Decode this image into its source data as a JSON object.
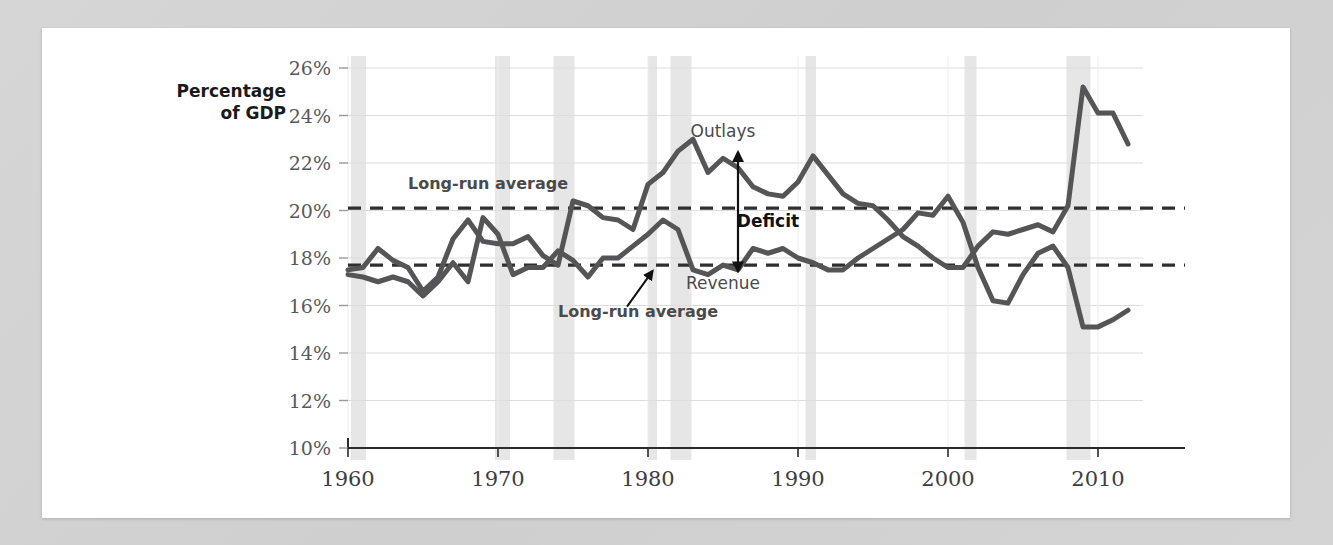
{
  "chart_data": {
    "type": "line",
    "title": "",
    "ylabel": "Percentage of GDP",
    "xlabel": "",
    "ylim": [
      10,
      26
    ],
    "xlim": [
      1960,
      2013
    ],
    "yticks": [
      "10%",
      "12%",
      "14%",
      "16%",
      "18%",
      "20%",
      "22%",
      "24%",
      "26%"
    ],
    "ytick_values": [
      10,
      12,
      14,
      16,
      18,
      20,
      22,
      24,
      26
    ],
    "xticks": [
      "1960",
      "1970",
      "1980",
      "1990",
      "2000",
      "2010"
    ],
    "xtick_values": [
      1960,
      1970,
      1980,
      1990,
      2000,
      2010
    ],
    "grid": true,
    "legend_position": "inline-annotations",
    "series": [
      {
        "name": "Outlays",
        "color": "#555557",
        "x": [
          1960,
          1961,
          1962,
          1963,
          1964,
          1965,
          1966,
          1967,
          1968,
          1969,
          1970,
          1971,
          1972,
          1973,
          1974,
          1975,
          1976,
          1977,
          1978,
          1979,
          1980,
          1981,
          1982,
          1983,
          1984,
          1985,
          1986,
          1987,
          1988,
          1989,
          1990,
          1991,
          1992,
          1993,
          1994,
          1995,
          1996,
          1997,
          1998,
          1999,
          2000,
          2001,
          2002,
          2003,
          2004,
          2005,
          2006,
          2007,
          2008,
          2009,
          2010,
          2011,
          2012
        ],
        "values": [
          17.5,
          17.6,
          18.4,
          17.9,
          17.6,
          16.6,
          17.2,
          18.8,
          19.6,
          18.7,
          18.6,
          18.6,
          18.9,
          18.1,
          17.7,
          20.4,
          20.2,
          19.7,
          19.6,
          19.2,
          21.1,
          21.6,
          22.5,
          23.0,
          21.6,
          22.2,
          21.8,
          21.0,
          20.7,
          20.6,
          21.2,
          22.3,
          21.5,
          20.7,
          20.3,
          20.2,
          19.6,
          18.9,
          18.5,
          18.0,
          17.6,
          17.6,
          18.5,
          19.1,
          19.0,
          19.2,
          19.4,
          19.1,
          20.2,
          25.2,
          24.1,
          24.1,
          22.8
        ]
      },
      {
        "name": "Revenue",
        "color": "#555557",
        "x": [
          1960,
          1961,
          1962,
          1963,
          1964,
          1965,
          1966,
          1967,
          1968,
          1969,
          1970,
          1971,
          1972,
          1973,
          1974,
          1975,
          1976,
          1977,
          1978,
          1979,
          1980,
          1981,
          1982,
          1983,
          1984,
          1985,
          1986,
          1987,
          1988,
          1989,
          1990,
          1991,
          1992,
          1993,
          1994,
          1995,
          1996,
          1997,
          1998,
          1999,
          2000,
          2001,
          2002,
          2003,
          2004,
          2005,
          2006,
          2007,
          2008,
          2009,
          2010,
          2011,
          2012
        ],
        "values": [
          17.3,
          17.2,
          17.0,
          17.2,
          17.0,
          16.4,
          17.0,
          17.8,
          17.0,
          19.7,
          19.0,
          17.3,
          17.6,
          17.6,
          18.3,
          17.9,
          17.2,
          18.0,
          18.0,
          18.5,
          19.0,
          19.6,
          19.2,
          17.5,
          17.3,
          17.7,
          17.5,
          18.4,
          18.2,
          18.4,
          18.0,
          17.8,
          17.5,
          17.5,
          18.0,
          18.4,
          18.8,
          19.2,
          19.9,
          19.8,
          20.6,
          19.5,
          17.6,
          16.2,
          16.1,
          17.3,
          18.2,
          18.5,
          17.6,
          15.1,
          15.1,
          15.4,
          15.8
        ]
      }
    ],
    "reference_lines": [
      {
        "label": "Long-run average",
        "value": 20.1,
        "series": "Outlays",
        "style": "dashed"
      },
      {
        "label": "Long-run average",
        "value": 17.7,
        "series": "Revenue",
        "style": "dashed"
      }
    ],
    "annotations": [
      {
        "text": "Outlays",
        "x": 1985,
        "y": 23.1
      },
      {
        "text": "Revenue",
        "x": 1985,
        "y": 16.7
      },
      {
        "text": "Deficit",
        "x": 1988,
        "y": 19.3
      },
      {
        "text": "Long-run average",
        "x": 1964,
        "y": 20.9
      },
      {
        "text": "Long-run average",
        "x": 1974,
        "y": 15.5
      }
    ],
    "recession_bands": [
      {
        "start": 1960.2,
        "end": 1961.2
      },
      {
        "start": 1969.8,
        "end": 1970.8
      },
      {
        "start": 1973.7,
        "end": 1975.1
      },
      {
        "start": 1980.0,
        "end": 1980.6
      },
      {
        "start": 1981.5,
        "end": 1982.9
      },
      {
        "start": 1990.5,
        "end": 1991.2
      },
      {
        "start": 2001.1,
        "end": 2001.9
      },
      {
        "start": 2007.9,
        "end": 2009.5
      }
    ],
    "band_color": "#e6e6e6",
    "grid_color": "#dcdcdc",
    "axis_color": "#2b2b2b"
  }
}
